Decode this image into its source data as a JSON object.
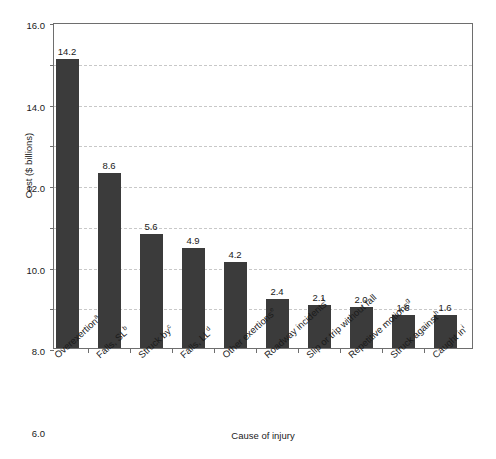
{
  "figure": {
    "top_caption_fragment": "",
    "background": "#ffffff"
  },
  "chart_data": {
    "type": "bar",
    "title": "",
    "xlabel": "Cause of injury",
    "ylabel": "Cost ($ billions)",
    "categories": [
      "Overexertion",
      "Falls, SL",
      "Struck by",
      "Falls, LL",
      "Other exertions",
      "Roadway incidents",
      "Slip or trip without fall",
      "Repetitive motions",
      "Struck against",
      "Caught in"
    ],
    "category_footnotes": [
      "a",
      "b",
      "c",
      "d",
      "e",
      "f",
      "",
      "g",
      "h",
      "i"
    ],
    "values": [
      14.2,
      8.6,
      5.6,
      4.9,
      4.2,
      2.4,
      2.1,
      2.0,
      1.6,
      1.6
    ],
    "value_labels": [
      "14.2",
      "8.6",
      "5.6",
      "4.9",
      "4.2",
      "2.4",
      "2.1",
      "2.0",
      "1.6",
      "1.6"
    ],
    "ylim": [
      0.0,
      16.0
    ],
    "ytick_values": [
      0.0,
      2.0,
      4.0,
      6.0,
      8.0,
      10.0,
      12.0,
      14.0,
      16.0
    ],
    "ytick_labels": [
      "0.0",
      "2.0",
      "4.0",
      "6.0",
      "8.0",
      "10.0",
      "12.0",
      "14.0",
      "16.0"
    ],
    "grid": true,
    "grid_axis": "y",
    "grid_style": "dashed",
    "grid_color": "#c8c8c8",
    "bar_color": "#3b3b3b",
    "axis_color": "#6e6e6e",
    "legend": null
  }
}
